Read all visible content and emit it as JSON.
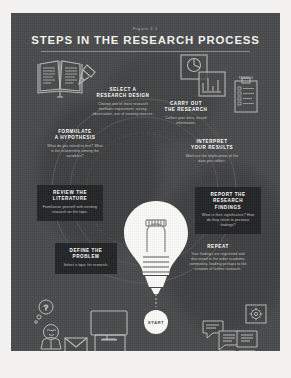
{
  "poster": {
    "figure_number": "Figure 2.1",
    "title": "STEPS IN THE RESEARCH PROCESS",
    "start_label": "START",
    "colors": {
      "panel_bg": "#494a4b",
      "card_bg": "#232425",
      "title": "#f4f4f2",
      "body_text": "#c9c9c5",
      "bulb": "#fbfbf9",
      "page_bg": "#f2f1ef"
    }
  },
  "steps": [
    {
      "id": "select-a-research-design",
      "heading": "SELECT A\nRESEARCH DESIGN",
      "heading_line1": "SELECT A",
      "heading_line2": "RESEARCH DESIGN",
      "body": "Choose one or more research methods: experiment, survey, observation, use of existing sources."
    },
    {
      "id": "carry-out-the-research",
      "heading_line1": "CARRY OUT",
      "heading_line2": "THE RESEARCH",
      "body": "Collect your data, record information."
    },
    {
      "id": "interpret-your-results",
      "heading_line1": "INTERPRET",
      "heading_line2": "YOUR RESULTS",
      "body": "Work out the implications of the data you collect."
    },
    {
      "id": "report-the-research-findings",
      "heading_line1": "REPORT THE",
      "heading_line2": "RESEARCH",
      "heading_line3": "FINDINGS",
      "body": "What is their significance? How do they relate to previous findings?"
    },
    {
      "id": "repeat",
      "heading_line1": "REPEAT",
      "body": "Your findings are registered and discussed in the wider academic community, leading perhaps to the creation of further research."
    },
    {
      "id": "formulate-a-hypothesis",
      "heading_line1": "FORMULATE",
      "heading_line2": "A HYPOTHESIS",
      "body": "What do you intend to test? What is the relationship among the variables?"
    },
    {
      "id": "review-the-literature",
      "heading_line1": "REVIEW THE",
      "heading_line2": "LITERATURE",
      "body": "Familiarize yourself with existing research on the topic."
    },
    {
      "id": "define-the-problem",
      "heading_line1": "DEFINE THE",
      "heading_line2": "PROBLEM",
      "body": "Select a topic for research."
    }
  ],
  "icons": {
    "book": "open-book-icon",
    "pencil": "pencil-icon",
    "pie_chart": "pie-chart-icon",
    "bar_chart": "bar-chart-icon",
    "clipboard": "clipboard-survey-icon",
    "clipboard_label": "RESEARCH",
    "thinker": "person-thinking-icon",
    "question": "question-mark-icon",
    "monitor": "computer-monitor-icon",
    "envelope": "envelope-icon",
    "monitor2": "computer-monitor-icon",
    "documents": "documents-icon",
    "gear": "gear-icon",
    "speech": "speech-bubbles-icon",
    "lightbulb": "lightbulb-icon"
  }
}
